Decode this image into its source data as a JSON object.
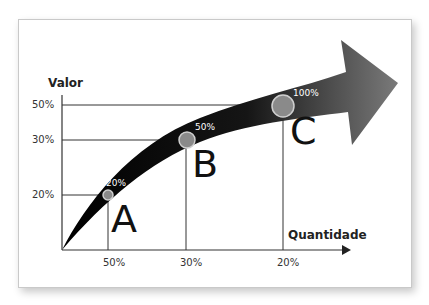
{
  "diagram": {
    "y_axis_title": "Valor",
    "x_axis_title": "Quantidade",
    "y_ticks": [
      "50%",
      "30%",
      "20%"
    ],
    "x_ticks": [
      "50%",
      "30%",
      "20%"
    ],
    "points": [
      {
        "letter": "A",
        "label": "20%"
      },
      {
        "letter": "B",
        "label": "50%"
      },
      {
        "letter": "C",
        "label": "100%"
      }
    ],
    "colors": {
      "arrow_dark": "#0a0a0a",
      "arrow_light": "#6e6e6e",
      "point_fill": "#8a8a8a",
      "point_stroke": "#c8c8c8",
      "line": "#333333"
    }
  }
}
